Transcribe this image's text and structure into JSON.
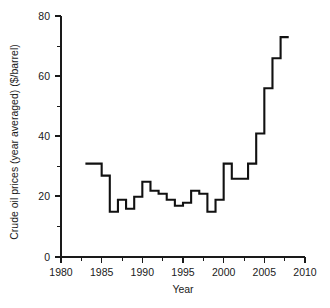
{
  "chart_data": {
    "type": "line",
    "subtype": "step-post",
    "title": "",
    "xlabel": "Year",
    "ylabel": "Crude oil prices (year averaged) ($/barrel)",
    "xlim": [
      1980,
      2010
    ],
    "ylim": [
      0,
      80
    ],
    "grid": false,
    "legend": null,
    "xticks_major": [
      1980,
      1985,
      1990,
      1995,
      2000,
      2005,
      2010
    ],
    "xtick_labels": [
      "1980",
      "1985",
      "1990",
      "1995",
      "2000",
      "2005",
      "2010"
    ],
    "xticks_minor": [
      1982.5,
      1987.5,
      1992.5,
      1997.5,
      2002.5,
      2007.5
    ],
    "yticks_major": [
      0,
      20,
      40,
      60,
      80
    ],
    "ytick_labels": [
      "0",
      "20",
      "40",
      "60",
      "80"
    ],
    "yticks_minor": [
      10,
      30,
      50,
      70
    ],
    "series_color": "#111111",
    "x": [
      1983,
      1984,
      1985,
      1986,
      1987,
      1988,
      1989,
      1990,
      1991,
      1992,
      1993,
      1994,
      1995,
      1996,
      1997,
      1998,
      1999,
      2000,
      2001,
      2002,
      2003,
      2004,
      2005,
      2006,
      2007
    ],
    "values": [
      31,
      31,
      27,
      15,
      19,
      16,
      20,
      25,
      22,
      21,
      19,
      17,
      18,
      22,
      21,
      15,
      19,
      31,
      26,
      26,
      31,
      41,
      56,
      66,
      73
    ]
  },
  "caption": {
    "text": "",
    "visible": false
  }
}
